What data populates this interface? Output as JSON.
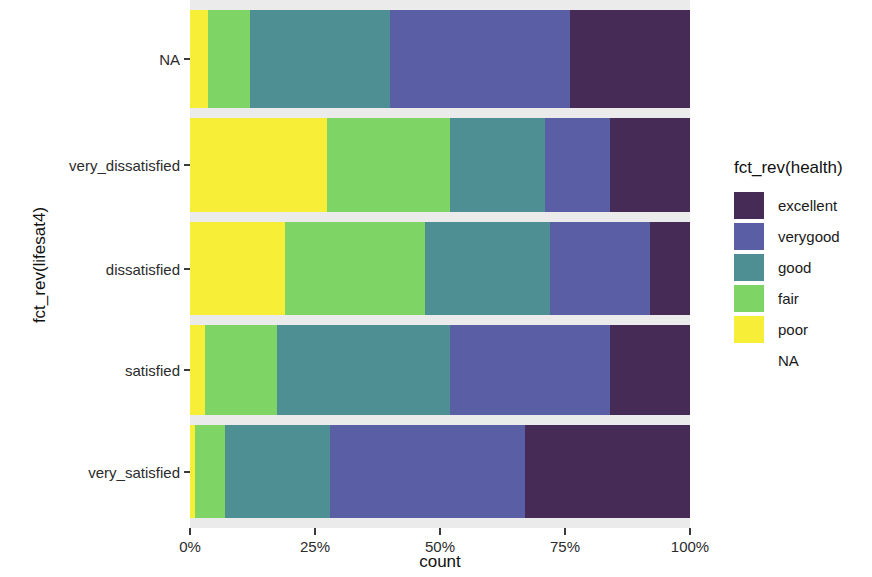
{
  "chart_data": {
    "type": "bar",
    "orientation": "horizontal",
    "stacked": true,
    "stack_mode": "fill",
    "title": "",
    "xlabel": "count",
    "ylabel": "fct_rev(lifesat4)",
    "xlim": [
      0,
      100
    ],
    "x_tick_labels": [
      "0%",
      "25%",
      "50%",
      "75%",
      "100%"
    ],
    "x_tick_values": [
      0,
      25,
      50,
      75,
      100
    ],
    "grid": false,
    "legend": {
      "title": "fct_rev(health)",
      "position": "right",
      "entries": [
        {
          "label": "excellent",
          "color": "#462b57"
        },
        {
          "label": "verygood",
          "color": "#5a5fa5"
        },
        {
          "label": "good",
          "color": "#4d8f92"
        },
        {
          "label": "fair",
          "color": "#7ed464"
        },
        {
          "label": "poor",
          "color": "#f7ee38"
        },
        {
          "label": "NA",
          "color": "#ffffff"
        }
      ]
    },
    "categories": [
      "NA",
      "very_dissatisfied",
      "dissatisfied",
      "satisfied",
      "very_satisfied"
    ],
    "series": [
      {
        "name": "poor",
        "color": "#f7ee38",
        "values": [
          3.6,
          27.4,
          19.0,
          3.0,
          1.0
        ]
      },
      {
        "name": "fair",
        "color": "#7ed464",
        "values": [
          8.4,
          24.6,
          28.0,
          14.4,
          6.0
        ]
      },
      {
        "name": "good",
        "color": "#4d8f92",
        "values": [
          28.0,
          19.0,
          25.0,
          34.6,
          21.0
        ]
      },
      {
        "name": "verygood",
        "color": "#5a5fa5",
        "values": [
          36.0,
          13.0,
          20.0,
          32.0,
          39.0
        ]
      },
      {
        "name": "excellent",
        "color": "#462b57",
        "values": [
          24.0,
          16.0,
          8.0,
          16.0,
          33.0
        ]
      }
    ],
    "bars": [
      {
        "category": "NA",
        "segments": [
          {
            "name": "poor",
            "color": "#f7ee38",
            "percent": 3.6
          },
          {
            "name": "fair",
            "color": "#7ed464",
            "percent": 8.4
          },
          {
            "name": "good",
            "color": "#4d8f92",
            "percent": 28.0
          },
          {
            "name": "verygood",
            "color": "#5a5fa5",
            "percent": 36.0
          },
          {
            "name": "excellent",
            "color": "#462b57",
            "percent": 24.0
          }
        ]
      },
      {
        "category": "very_dissatisfied",
        "segments": [
          {
            "name": "poor",
            "color": "#f7ee38",
            "percent": 27.4
          },
          {
            "name": "fair",
            "color": "#7ed464",
            "percent": 24.6
          },
          {
            "name": "good",
            "color": "#4d8f92",
            "percent": 19.0
          },
          {
            "name": "verygood",
            "color": "#5a5fa5",
            "percent": 13.0
          },
          {
            "name": "excellent",
            "color": "#462b57",
            "percent": 16.0
          }
        ]
      },
      {
        "category": "dissatisfied",
        "segments": [
          {
            "name": "poor",
            "color": "#f7ee38",
            "percent": 19.0
          },
          {
            "name": "fair",
            "color": "#7ed464",
            "percent": 28.0
          },
          {
            "name": "good",
            "color": "#4d8f92",
            "percent": 25.0
          },
          {
            "name": "verygood",
            "color": "#5a5fa5",
            "percent": 20.0
          },
          {
            "name": "excellent",
            "color": "#462b57",
            "percent": 8.0
          }
        ]
      },
      {
        "category": "satisfied",
        "segments": [
          {
            "name": "poor",
            "color": "#f7ee38",
            "percent": 3.0
          },
          {
            "name": "fair",
            "color": "#7ed464",
            "percent": 14.4
          },
          {
            "name": "good",
            "color": "#4d8f92",
            "percent": 34.6
          },
          {
            "name": "verygood",
            "color": "#5a5fa5",
            "percent": 32.0
          },
          {
            "name": "excellent",
            "color": "#462b57",
            "percent": 16.0
          }
        ]
      },
      {
        "category": "very_satisfied",
        "segments": [
          {
            "name": "poor",
            "color": "#f7ee38",
            "percent": 1.0
          },
          {
            "name": "fair",
            "color": "#7ed464",
            "percent": 6.0
          },
          {
            "name": "good",
            "color": "#4d8f92",
            "percent": 21.0
          },
          {
            "name": "verygood",
            "color": "#5a5fa5",
            "percent": 39.0
          },
          {
            "name": "excellent",
            "color": "#462b57",
            "percent": 33.0
          }
        ]
      }
    ],
    "panel_background": "#ebebeb"
  }
}
